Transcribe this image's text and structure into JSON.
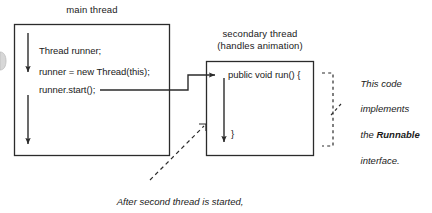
{
  "figure": {
    "kind": "thread-execution-diagram",
    "background_color": "#ffffff",
    "stroke_color": "#2b2b2b",
    "text_color": "#1a1a1a"
  },
  "main_thread": {
    "title": "main thread",
    "code_lines": [
      "Thread runner;",
      "runner = new Thread(this);",
      "runner.start();"
    ]
  },
  "secondary_thread": {
    "title_line1": "secondary thread",
    "title_line2": "(handles animation)",
    "code_open": "public void run() {",
    "code_close": "}"
  },
  "runnable_note": {
    "line1": "This code",
    "line2": "implements",
    "line3_prefix": "the ",
    "line3_bold": "Runnable",
    "line4": "interface."
  },
  "bottom_caption": {
    "line1": "After second thread is started,",
    "line2": "it runs in parallel to the main thread."
  }
}
